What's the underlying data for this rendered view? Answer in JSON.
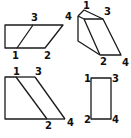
{
  "diagram": {
    "type": "folding-geometry-figure",
    "panels": [
      {
        "id": "top-left",
        "description": "Rectangle with parallelogram sharing bottom edge",
        "labels": [
          {
            "text": "3",
            "x": 31,
            "y": 21
          },
          {
            "text": "4",
            "x": 65,
            "y": 20
          },
          {
            "text": "1",
            "x": 12,
            "y": 59
          },
          {
            "text": "2",
            "x": 44,
            "y": 59
          }
        ]
      },
      {
        "id": "top-right",
        "description": "Folded prism shape",
        "labels": [
          {
            "text": "1",
            "x": 84,
            "y": 9
          },
          {
            "text": "3",
            "x": 104,
            "y": 15
          },
          {
            "text": "4",
            "x": 62,
            "y": 20
          },
          {
            "text": "2",
            "x": 100,
            "y": 64
          },
          {
            "text": "4",
            "x": 122,
            "y": 66
          }
        ]
      },
      {
        "id": "bottom-left",
        "description": "Trapezoid with diagonal fold line",
        "labels": [
          {
            "text": "1",
            "x": 13,
            "y": 75
          },
          {
            "text": "3",
            "x": 35,
            "y": 75
          },
          {
            "text": "2",
            "x": 45,
            "y": 128
          },
          {
            "text": "4",
            "x": 67,
            "y": 125
          }
        ]
      },
      {
        "id": "bottom-right",
        "description": "Tall rectangle",
        "labels": [
          {
            "text": "1",
            "x": 84,
            "y": 81
          },
          {
            "text": "3",
            "x": 112,
            "y": 81
          },
          {
            "text": "2",
            "x": 84,
            "y": 123
          },
          {
            "text": "4",
            "x": 112,
            "y": 123
          }
        ]
      }
    ]
  }
}
